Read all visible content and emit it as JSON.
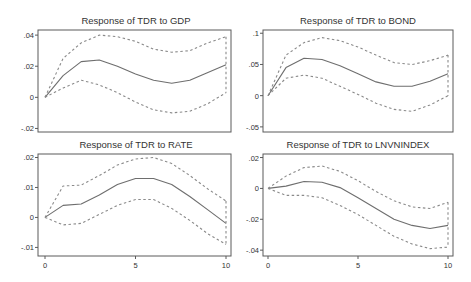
{
  "figure": {
    "colors": {
      "frame": "#5a5a5a",
      "mid_line": "#6e6e6e",
      "band_line": "#8a8a8a",
      "text": "#333333",
      "background": "#ffffff"
    }
  },
  "chart_data": [
    {
      "type": "line",
      "title": "Response of TDR to GDP",
      "xlabel": "",
      "ylabel": "",
      "x": [
        0,
        1,
        2,
        3,
        4,
        5,
        6,
        7,
        8,
        9,
        10
      ],
      "xlim": [
        0,
        10
      ],
      "ylim": [
        -0.021,
        0.042
      ],
      "yticks": [
        0.04,
        0.02,
        0,
        -0.02
      ],
      "ytick_labels": [
        ".04",
        ".02",
        "0",
        "-.02"
      ],
      "xticks": [],
      "xtick_labels": [],
      "grid": false,
      "series": [
        {
          "name": "response",
          "style": "solid",
          "values": [
            0,
            0.014,
            0.023,
            0.024,
            0.02,
            0.015,
            0.011,
            0.009,
            0.011,
            0.016,
            0.021
          ]
        },
        {
          "name": "upper_ci",
          "style": "dashed",
          "values": [
            0,
            0.025,
            0.035,
            0.04,
            0.039,
            0.036,
            0.031,
            0.029,
            0.03,
            0.035,
            0.039
          ]
        },
        {
          "name": "lower_ci",
          "style": "dashed",
          "values": [
            0,
            0.006,
            0.011,
            0.008,
            0.003,
            -0.003,
            -0.008,
            -0.01,
            -0.009,
            -0.004,
            0.003
          ]
        }
      ]
    },
    {
      "type": "line",
      "title": "Response of TDR to BOND",
      "xlabel": "",
      "ylabel": "",
      "x": [
        0,
        1,
        2,
        3,
        4,
        5,
        6,
        7,
        8,
        9,
        10
      ],
      "xlim": [
        0,
        10
      ],
      "ylim": [
        -0.055,
        0.102
      ],
      "yticks": [
        0.1,
        0.05,
        0,
        -0.05
      ],
      "ytick_labels": [
        ".1",
        ".05",
        "0",
        "-.05"
      ],
      "xticks": [],
      "xtick_labels": [],
      "grid": false,
      "series": [
        {
          "name": "response",
          "style": "solid",
          "values": [
            0,
            0.045,
            0.06,
            0.058,
            0.048,
            0.035,
            0.022,
            0.015,
            0.015,
            0.023,
            0.035
          ]
        },
        {
          "name": "upper_ci",
          "style": "dashed",
          "values": [
            0,
            0.065,
            0.085,
            0.093,
            0.088,
            0.078,
            0.065,
            0.053,
            0.05,
            0.056,
            0.065
          ]
        },
        {
          "name": "lower_ci",
          "style": "dashed",
          "values": [
            0,
            0.028,
            0.033,
            0.028,
            0.015,
            0.002,
            -0.012,
            -0.022,
            -0.025,
            -0.015,
            0
          ]
        }
      ]
    },
    {
      "type": "line",
      "title": "Response of TDR to RATE",
      "xlabel": "",
      "ylabel": "",
      "x": [
        0,
        1,
        2,
        3,
        4,
        5,
        6,
        7,
        8,
        9,
        10
      ],
      "xlim": [
        0,
        10
      ],
      "ylim": [
        -0.0122,
        0.0205
      ],
      "yticks": [
        0.02,
        0.01,
        0,
        -0.01
      ],
      "ytick_labels": [
        ".02",
        ".01",
        "0",
        "-.01"
      ],
      "xticks": [
        0,
        5,
        10
      ],
      "xtick_labels": [
        "0",
        "5",
        "10"
      ],
      "grid": false,
      "series": [
        {
          "name": "response",
          "style": "solid",
          "values": [
            0,
            0.004,
            0.0045,
            0.0075,
            0.011,
            0.013,
            0.013,
            0.011,
            0.007,
            0.0025,
            -0.002
          ]
        },
        {
          "name": "upper_ci",
          "style": "dashed",
          "values": [
            0,
            0.0105,
            0.0108,
            0.014,
            0.0175,
            0.0195,
            0.02,
            0.018,
            0.014,
            0.0095,
            0.0055
          ]
        },
        {
          "name": "lower_ci",
          "style": "dashed",
          "values": [
            0,
            -0.0025,
            -0.002,
            0.001,
            0.004,
            0.006,
            0.006,
            0.003,
            -0.001,
            -0.0055,
            -0.009
          ]
        }
      ]
    },
    {
      "type": "line",
      "title": "Response of TDR to LNVNINDEX",
      "xlabel": "",
      "ylabel": "",
      "x": [
        0,
        1,
        2,
        3,
        4,
        5,
        6,
        7,
        8,
        9,
        10
      ],
      "xlim": [
        0,
        10
      ],
      "ylim": [
        -0.0425,
        0.021
      ],
      "yticks": [
        0.02,
        0,
        -0.02,
        -0.04
      ],
      "ytick_labels": [
        ".02",
        "0",
        "-.02",
        "-.04"
      ],
      "xticks": [
        0,
        5,
        10
      ],
      "xtick_labels": [
        "0",
        "5",
        "10"
      ],
      "grid": false,
      "series": [
        {
          "name": "response",
          "style": "solid",
          "values": [
            0,
            0.0015,
            0.0045,
            0.004,
            0.0005,
            -0.006,
            -0.013,
            -0.02,
            -0.024,
            -0.026,
            -0.024
          ]
        },
        {
          "name": "upper_ci",
          "style": "dashed",
          "values": [
            0,
            0.008,
            0.0135,
            0.0145,
            0.011,
            0.005,
            -0.002,
            -0.008,
            -0.012,
            -0.013,
            -0.009
          ]
        },
        {
          "name": "lower_ci",
          "style": "dashed",
          "values": [
            0,
            -0.0045,
            -0.0045,
            -0.006,
            -0.011,
            -0.017,
            -0.024,
            -0.031,
            -0.036,
            -0.039,
            -0.038
          ]
        }
      ]
    }
  ]
}
